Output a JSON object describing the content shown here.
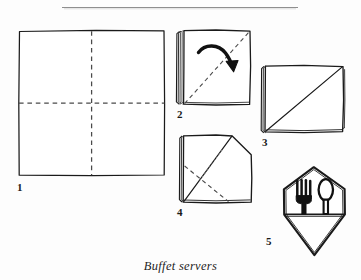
{
  "figure": {
    "caption": "Buffet servers",
    "title_rule": {
      "present": true,
      "x_start": 62,
      "x_end": 298,
      "y": 7,
      "color": "#8a8a8a"
    },
    "background_color": "#fdfdfd",
    "ink_color": "#1a1a1a",
    "fold_line_color": "#5a5a5a",
    "steps": [
      {
        "number": "1",
        "label": "1",
        "name": "step-1-flat-napkin",
        "description": "Flat open square napkin with vertical and horizontal dashed fold lines",
        "label_x": 17,
        "label_y": 182
      },
      {
        "number": "2",
        "label": "2",
        "name": "step-2-folded-square",
        "description": "Napkin folded into quarters, dashed diagonal fold line with curved arrow folding top-left corner down to bottom-right",
        "label_x": 177,
        "label_y": 109
      },
      {
        "number": "3",
        "label": "3",
        "name": "step-3-diagonal-fold",
        "description": "Square with solid diagonal crease from bottom-left to top-right",
        "label_x": 262,
        "label_y": 137
      },
      {
        "number": "4",
        "label": "4",
        "name": "step-4-corner-turned",
        "description": "Square with top-right corner folded outward forming a point, dashed fold lines indicating the next folds",
        "label_x": 177,
        "label_y": 207
      },
      {
        "number": "5",
        "label": "5",
        "name": "step-5-finished-pocket",
        "description": "Finished hexagonal buffet server pocket holding a fork and a spoon",
        "label_x": 266,
        "label_y": 236
      }
    ],
    "cutlery": [
      {
        "name": "fork-icon",
        "tines": 4
      },
      {
        "name": "spoon-icon",
        "tines": 0
      }
    ]
  }
}
